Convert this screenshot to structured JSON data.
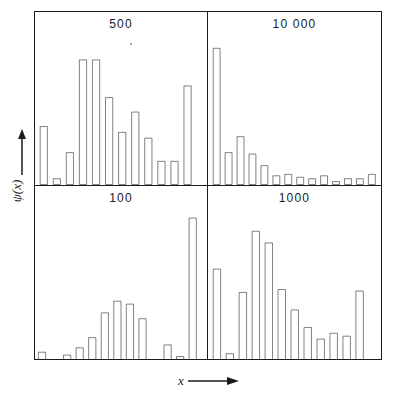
{
  "figure": {
    "type": "multi-panel-histogram",
    "panel_count": 4,
    "style": "outline-bars",
    "line_color": "#1b1b1b",
    "bar_fill": "#ffffff"
  },
  "axes": {
    "ylabel": "ψ(x)",
    "ylabel_icon": "up-arrow",
    "xlabel": "x",
    "xlabel_icon": "right-arrow"
  },
  "chart_data": [
    {
      "type": "bar",
      "title": "500",
      "panel_position": "top-left",
      "xlabel": "x",
      "ylabel": "ψ(x)",
      "ylim": [
        0,
        1
      ],
      "grid": false,
      "legend": "none",
      "categories": [
        "1",
        "2",
        "3",
        "4",
        "5",
        "6",
        "7",
        "8",
        "9",
        "10",
        "11",
        "12",
        "13",
        "14",
        "15"
      ],
      "values": [
        0.4,
        0.04,
        0.22,
        0.86,
        0.86,
        0.6,
        0.36,
        0.5,
        0.32,
        0.16,
        0.16,
        0.68
      ]
    },
    {
      "type": "bar",
      "title": "10 000",
      "panel_position": "top-right",
      "xlabel": "x",
      "ylabel": "ψ(x)",
      "ylim": [
        0,
        1
      ],
      "grid": false,
      "legend": "none",
      "categories": [
        "1",
        "2",
        "3",
        "4",
        "5",
        "6",
        "7",
        "8",
        "9",
        "10",
        "11",
        "12",
        "13",
        "14"
      ],
      "values": [
        0.94,
        0.22,
        0.33,
        0.21,
        0.13,
        0.06,
        0.07,
        0.05,
        0.04,
        0.06,
        0.02,
        0.04,
        0.04,
        0.07
      ]
    },
    {
      "type": "bar",
      "title": "100",
      "panel_position": "bottom-left",
      "xlabel": "x",
      "ylabel": "ψ(x)",
      "ylim": [
        0,
        1
      ],
      "grid": false,
      "legend": "none",
      "categories": [
        "1",
        "2",
        "3",
        "4",
        "5",
        "6",
        "7",
        "8",
        "9",
        "10",
        "11",
        "12"
      ],
      "values": [
        0.05,
        0.0,
        0.03,
        0.08,
        0.15,
        0.32,
        0.4,
        0.38,
        0.28,
        0.0,
        0.1,
        0.02,
        0.97
      ]
    },
    {
      "type": "bar",
      "title": "1000",
      "panel_position": "bottom-right",
      "xlabel": "x",
      "ylabel": "ψ(x)",
      "ylim": [
        0,
        1
      ],
      "grid": false,
      "legend": "none",
      "categories": [
        "1",
        "2",
        "3",
        "4",
        "5",
        "6",
        "7",
        "8",
        "9",
        "10",
        "11",
        "12",
        "13"
      ],
      "values": [
        0.62,
        0.04,
        0.46,
        0.88,
        0.8,
        0.48,
        0.34,
        0.22,
        0.14,
        0.18,
        0.16,
        0.47
      ]
    }
  ],
  "panels": {
    "top_left": {
      "title": "500"
    },
    "top_right": {
      "title": "10 000"
    },
    "bottom_left": {
      "title": "100"
    },
    "bottom_right": {
      "title": "1000"
    }
  }
}
